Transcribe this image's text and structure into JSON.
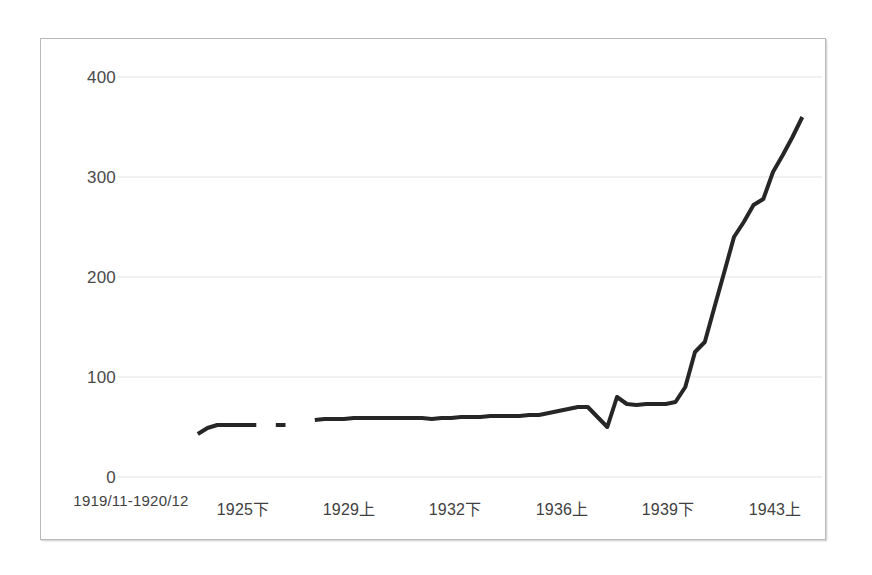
{
  "chart_data": {
    "type": "line",
    "title": "",
    "subtitle": "",
    "xlabel": "",
    "ylabel": "",
    "ylim": [
      0,
      400
    ],
    "ytick_values": [
      0,
      100,
      200,
      300,
      400
    ],
    "ytick_labels": [
      "0",
      "100",
      "200",
      "300",
      "400"
    ],
    "grid": "horizontal",
    "legend": "none",
    "legend_position": "none",
    "line_color": "#262626",
    "line_width": 4,
    "xtick_labels": [
      "1919/11-1920/12",
      "1925下",
      "1929上",
      "1932下",
      "1936上",
      "1939下",
      "1943上"
    ],
    "xtick_positions": [
      0,
      11,
      22,
      33,
      44,
      55,
      66
    ],
    "x_index_min": 0,
    "x_index_max": 72,
    "note_gaps": "two short breaks in the line near index 25 and index 34 indicate missing data points",
    "series": [
      {
        "name": "series-1",
        "points": [
          {
            "x": 9,
            "y": 43
          },
          {
            "x": 10,
            "y": 49
          },
          {
            "x": 11,
            "y": 52
          },
          {
            "x": 12,
            "y": 52
          },
          {
            "x": 13,
            "y": 52
          },
          {
            "x": 14,
            "y": 52
          },
          {
            "x": 15,
            "y": 52
          },
          {
            "x": 17,
            "y": 52
          },
          {
            "x": 18,
            "y": 52
          },
          {
            "x": 21,
            "y": 57
          },
          {
            "x": 22,
            "y": 58
          },
          {
            "x": 23,
            "y": 58
          },
          {
            "x": 24,
            "y": 58
          },
          {
            "x": 25,
            "y": 59
          },
          {
            "x": 26,
            "y": 59
          },
          {
            "x": 27,
            "y": 59
          },
          {
            "x": 28,
            "y": 59
          },
          {
            "x": 29,
            "y": 59
          },
          {
            "x": 30,
            "y": 59
          },
          {
            "x": 31,
            "y": 59
          },
          {
            "x": 32,
            "y": 59
          },
          {
            "x": 33,
            "y": 58
          },
          {
            "x": 34,
            "y": 59
          },
          {
            "x": 35,
            "y": 59
          },
          {
            "x": 36,
            "y": 60
          },
          {
            "x": 37,
            "y": 60
          },
          {
            "x": 38,
            "y": 60
          },
          {
            "x": 39,
            "y": 61
          },
          {
            "x": 40,
            "y": 61
          },
          {
            "x": 41,
            "y": 61
          },
          {
            "x": 42,
            "y": 61
          },
          {
            "x": 43,
            "y": 62
          },
          {
            "x": 44,
            "y": 62
          },
          {
            "x": 45,
            "y": 64
          },
          {
            "x": 46,
            "y": 66
          },
          {
            "x": 47,
            "y": 68
          },
          {
            "x": 48,
            "y": 70
          },
          {
            "x": 49,
            "y": 70
          },
          {
            "x": 50,
            "y": 60
          },
          {
            "x": 51,
            "y": 50
          },
          {
            "x": 52,
            "y": 80
          },
          {
            "x": 53,
            "y": 73
          },
          {
            "x": 54,
            "y": 72
          },
          {
            "x": 55,
            "y": 73
          },
          {
            "x": 56,
            "y": 73
          },
          {
            "x": 57,
            "y": 73
          },
          {
            "x": 58,
            "y": 75
          },
          {
            "x": 59,
            "y": 90
          },
          {
            "x": 60,
            "y": 125
          },
          {
            "x": 61,
            "y": 135
          },
          {
            "x": 62,
            "y": 170
          },
          {
            "x": 63,
            "y": 205
          },
          {
            "x": 64,
            "y": 240
          },
          {
            "x": 65,
            "y": 255
          },
          {
            "x": 66,
            "y": 272
          },
          {
            "x": 67,
            "y": 278
          },
          {
            "x": 68,
            "y": 305
          },
          {
            "x": 69,
            "y": 322
          },
          {
            "x": 70,
            "y": 340
          },
          {
            "x": 71,
            "y": 360
          }
        ]
      }
    ]
  }
}
